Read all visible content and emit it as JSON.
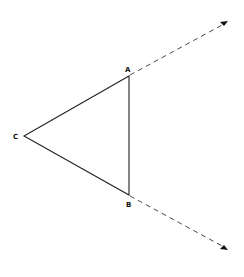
{
  "diagram": {
    "type": "geometry",
    "points": {
      "A": {
        "label": "A",
        "x": 129,
        "y": 76
      },
      "B": {
        "label": "B",
        "x": 129,
        "y": 195
      },
      "C": {
        "label": "C",
        "x": 24,
        "y": 136
      }
    },
    "segments": [
      {
        "from": "A",
        "to": "B",
        "style": "solid"
      },
      {
        "from": "B",
        "to": "C",
        "style": "solid"
      },
      {
        "from": "C",
        "to": "A",
        "style": "solid"
      }
    ],
    "rays": [
      {
        "from": "A",
        "to": {
          "x": 227,
          "y": 22
        },
        "style": "dashed",
        "arrow": true
      },
      {
        "from": "B",
        "to": {
          "x": 227,
          "y": 249
        },
        "style": "dashed",
        "arrow": true
      }
    ],
    "colors": {
      "stroke": "#222222",
      "background": "#ffffff"
    }
  }
}
